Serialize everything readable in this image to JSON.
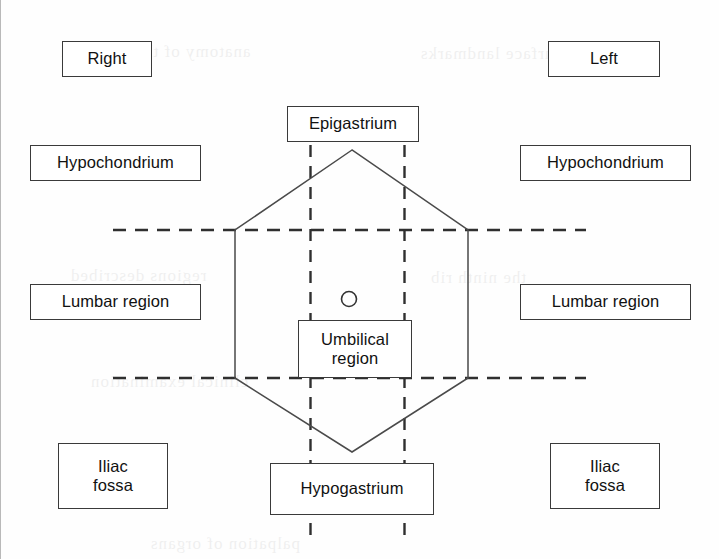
{
  "figure": {
    "background_color": "#fefefe",
    "line_color": "#3a3a3a",
    "text_color": "#111111"
  },
  "labels": {
    "right_header": "Right",
    "left_header": "Left",
    "right_hypochondrium": "Hypochondrium",
    "left_hypochondrium": "Hypochondrium",
    "right_lumbar": "Lumbar region",
    "left_lumbar": "Lumbar region",
    "right_iliac_line1": "Iliac",
    "right_iliac_line2": "fossa",
    "left_iliac_line1": "Iliac",
    "left_iliac_line2": "fossa",
    "epigastrium": "Epigastrium",
    "umbilical_line1": "Umbilical",
    "umbilical_line2": "region",
    "hypogastrium": "Hypogastrium"
  },
  "markers": {
    "umbilicus": "umbilicus-circle"
  },
  "guide_lines": {
    "upper_transverse": "subcostal-plane-dashed",
    "lower_transverse": "intertubercular-plane-dashed",
    "left_vertical": "left-midclavicular-plane-dashed",
    "right_vertical": "right-midclavicular-plane-dashed"
  },
  "outline": {
    "name": "abdomen-hexagon-outline",
    "points": "352,150 235,230 235,378 352,452 468,378 468,230"
  },
  "ghost_text": {
    "g1": "anatomy of the abdomen",
    "g2": "surface landmarks",
    "g3": "regions described",
    "g4": "the ninth rib",
    "g5": "clinical examination",
    "g6": "palpation of organs"
  }
}
